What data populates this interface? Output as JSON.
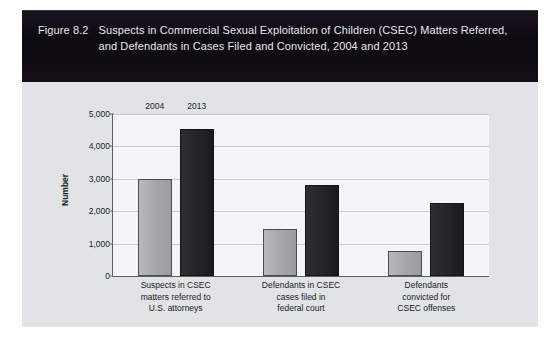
{
  "figure": {
    "number": "Figure 8.2",
    "title": "Suspects in Commercial Sexual Exploitation of Children (CSEC) Matters Referred, and Defendants in Cases Filed and Convicted, 2004 and 2013"
  },
  "colors": {
    "card_background": "#e2e3e6",
    "title_band": "#120d14",
    "title_text": "#e8e6ee",
    "plot_background": "#f4f5f7",
    "gridline": "#c9cbcf",
    "axis_line": "#5e5e5e",
    "series_2004": "#a9abae",
    "series_2013": "#262628",
    "text": "#1b1b1b"
  },
  "chart_data": {
    "type": "bar",
    "title": "Suspects in Commercial Sexual Exploitation of Children (CSEC) Matters Referred, and Defendants in Cases Filed and Convicted, 2004 and 2013",
    "xlabel": "",
    "ylabel": "Number",
    "ylim": [
      0,
      5000
    ],
    "yticks": [
      0,
      1000,
      2000,
      3000,
      4000,
      5000
    ],
    "ytick_labels": [
      "0",
      "1,000",
      "2,000",
      "3,000",
      "4,000",
      "5,000"
    ],
    "grid": true,
    "legend_position": "inline-bar-labels",
    "categories": [
      "Suspects in CSEC matters referred to U.S. attorneys",
      "Defendants in CSEC cases filed in federal court",
      "Defendants convicted for CSEC offenses"
    ],
    "category_lines": [
      [
        "Suspects in CSEC",
        "matters referred to",
        "U.S. attorneys"
      ],
      [
        "Defendants in CSEC",
        "cases filed in",
        "federal court"
      ],
      [
        "Defendants",
        "convicted for",
        "CSEC offenses"
      ]
    ],
    "series": [
      {
        "name": "2004",
        "values": [
          3000,
          1450,
          780
        ]
      },
      {
        "name": "2013",
        "values": [
          4550,
          2800,
          2250
        ]
      }
    ],
    "annotations": [
      {
        "text": "2004",
        "series": "2004",
        "category_index": 0
      },
      {
        "text": "2013",
        "series": "2013",
        "category_index": 0
      }
    ]
  }
}
